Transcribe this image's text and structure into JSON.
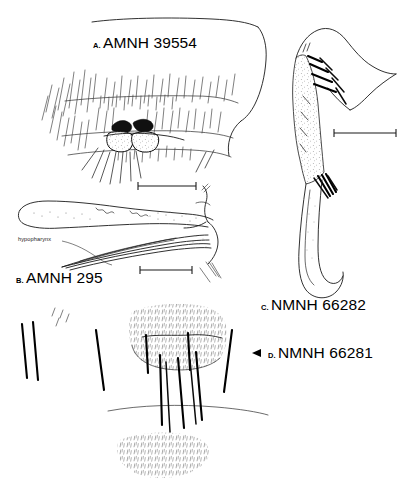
{
  "plate": {
    "background_color": "#ffffff",
    "ink_color": "#000000",
    "width": 404,
    "height": 498,
    "type": "scientific-line-illustration"
  },
  "panels": [
    {
      "letter": "A.",
      "id": "AMNH 39554",
      "subject": "mouthpart-labrum-with-setae",
      "has_scale_bar": true
    },
    {
      "letter": "B.",
      "id": "AMNH 295",
      "subject": "elongate-stylets-and-hypopharynx",
      "has_scale_bar": true
    },
    {
      "letter": "C.",
      "id": "NMNH 66282",
      "subject": "stippled-curved-appendage-with-bristles",
      "has_scale_bar": true
    },
    {
      "letter": "D.",
      "id": "NMNH 66281",
      "subject": "segmented-structure-with-dark-setae",
      "has_scale_bar": false,
      "marker": "left-pointing-arrowhead"
    }
  ],
  "annotations": [
    {
      "text": "hypopharynx",
      "target_panel": "B.",
      "leader_line": true
    }
  ],
  "scale_bars": [
    {
      "panel": "A.",
      "length_px": 60
    },
    {
      "panel": "B.",
      "length_px": 56
    },
    {
      "panel": "C.",
      "length_px": 64
    },
    {
      "panel": "B.",
      "length_px": 52
    }
  ]
}
